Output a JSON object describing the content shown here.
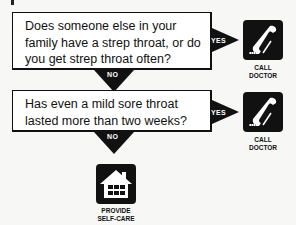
{
  "flowchart": {
    "questions": [
      {
        "text": "Does someone else in your family have a strep throat, or do you get strep throat often?"
      },
      {
        "text": "Has even a mild sore throat lasted more than two weeks?"
      }
    ],
    "yes_label": "YES",
    "no_label": "NO",
    "outcomes": {
      "call_doctor_1": {
        "caption_line1": "CALL",
        "caption_line2": "DOCTOR",
        "icon": "phone-icon"
      },
      "call_doctor_2": {
        "caption_line1": "CALL",
        "caption_line2": "DOCTOR",
        "icon": "phone-icon"
      },
      "self_care": {
        "caption_line1": "PROVIDE",
        "caption_line2": "SELF-CARE",
        "icon": "house-icon"
      }
    },
    "colors": {
      "ink": "#111111",
      "background": "#f7f7f5",
      "box": "#ffffff"
    }
  }
}
